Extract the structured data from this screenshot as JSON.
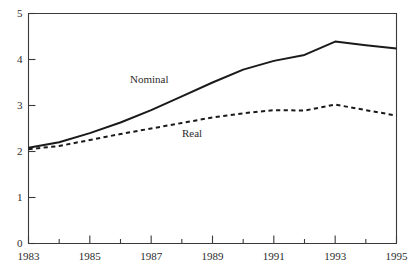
{
  "chart_data": {
    "type": "line",
    "title": "",
    "subtitle": "",
    "xlabel": "",
    "ylabel": "",
    "xlim": [
      1983,
      1995
    ],
    "ylim": [
      0,
      5
    ],
    "grid": false,
    "legend_position": "inline-annotations",
    "x_tick_labels": [
      "1983",
      "1985",
      "1987",
      "1989",
      "1991",
      "1993",
      "1995"
    ],
    "x_tick_values": [
      1983,
      1985,
      1987,
      1989,
      1991,
      1993,
      1995
    ],
    "x_minor_tick_values": [
      1984,
      1986,
      1988,
      1990,
      1992,
      1994
    ],
    "y_tick_labels": [
      "0",
      "1",
      "2",
      "3",
      "4",
      "5"
    ],
    "y_tick_values": [
      0,
      1,
      2,
      3,
      4,
      5
    ],
    "x": [
      1983,
      1984,
      1985,
      1986,
      1987,
      1988,
      1989,
      1990,
      1991,
      1992,
      1993,
      1994,
      1995
    ],
    "series": [
      {
        "name": "Nominal",
        "style": "solid",
        "color": "#1a1a1a",
        "values": [
          2.08,
          2.2,
          2.4,
          2.63,
          2.9,
          3.2,
          3.5,
          3.78,
          3.97,
          4.1,
          4.39,
          4.31,
          4.24
        ]
      },
      {
        "name": "Real",
        "style": "dashed",
        "color": "#1a1a1a",
        "values": [
          2.05,
          2.12,
          2.25,
          2.38,
          2.5,
          2.62,
          2.74,
          2.83,
          2.9,
          2.89,
          3.02,
          2.9,
          2.78
        ]
      }
    ],
    "annotations": [
      {
        "text": "Nominal",
        "x_px": 130,
        "y_px": 74
      },
      {
        "text": "Real",
        "x_px": 182,
        "y_px": 128
      }
    ],
    "axis_color": "#3a3a3a",
    "background": "#ffffff"
  }
}
